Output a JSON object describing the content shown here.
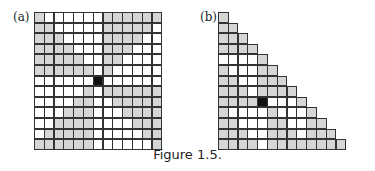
{
  "figure": {
    "caption": "Figure 1.5.",
    "colors": {
      "gray": "#d6d6d6",
      "white": "#ffffff",
      "black": "#111111",
      "grid_line": "#333333"
    },
    "panels": [
      {
        "label": "(a)",
        "shape": "13x13 square grid",
        "rows": [
          "GWWWWWWGGGGGG",
          "GGWWWWWGGGGGW",
          "GGGWWWWGGGGWW",
          "GGGGWWWGGGWWW",
          "GGGGGWWGGWWWW",
          "GGGGGGWGWWWWW",
          "WWWWWWBWWWWWW",
          "WWWWWGWGGGGGG",
          "WWWWGGWWGGGGG",
          "WWWGGGWWWGGGG",
          "WWGGGGWWWWGGG",
          "WGGGGGWWWWWGG",
          "GGGGGGWWWWWWG"
        ]
      },
      {
        "label": "(b)",
        "shape": "staircase triangle, 13 rows",
        "rows": [
          "G",
          "GG",
          "GGG",
          "GGGG",
          "WWWWG",
          "GWWWGG",
          "GGWWGGG",
          "GGGWGGGG",
          "GGGGBWWWG",
          "GWWWWGWWWG",
          "GGWWWGGWWGG",
          "GGGWWGGGWGGG",
          "GGGGWGGGGGGGG"
        ]
      }
    ]
  }
}
